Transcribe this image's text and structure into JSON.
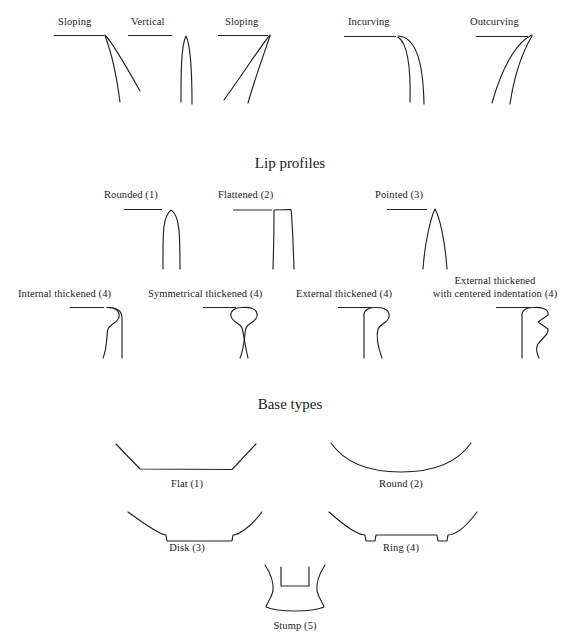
{
  "figure": {
    "title_orientation_row": "Rim orientation types",
    "sections": [
      {
        "id": "lip-profiles",
        "title": "Lip profiles"
      },
      {
        "id": "base-types",
        "title": "Base types"
      }
    ]
  },
  "rim_orientations": [
    {
      "key": "sloping-left",
      "label": "Sloping"
    },
    {
      "key": "vertical",
      "label": "Vertical"
    },
    {
      "key": "sloping-right",
      "label": "Sloping"
    },
    {
      "key": "incurving",
      "label": "Incurving"
    },
    {
      "key": "outcurving",
      "label": "Outcurving"
    }
  ],
  "lip_profiles_row1": [
    {
      "key": "rounded",
      "label": "Rounded (1)"
    },
    {
      "key": "flattened",
      "label": "Flattened (2)"
    },
    {
      "key": "pointed",
      "label": "Pointed (3)"
    }
  ],
  "lip_profiles_row2": [
    {
      "key": "internal-thickened",
      "label": "Internal thickened (4)"
    },
    {
      "key": "symmetrical-thickened",
      "label": "Symmetrical thickened (4)"
    },
    {
      "key": "external-thickened",
      "label": "External thickened (4)"
    },
    {
      "key": "external-thickened-indented",
      "label": "External thickened",
      "label_line2": "with centered indentation (4)"
    }
  ],
  "base_types": [
    {
      "key": "flat",
      "label": "Flat (1)"
    },
    {
      "key": "round",
      "label": "Round (2)"
    },
    {
      "key": "disk",
      "label": "Disk (3)"
    },
    {
      "key": "ring",
      "label": "Ring (4)"
    },
    {
      "key": "stump",
      "label": "Stump (5)"
    }
  ],
  "colors": {
    "ink": "#232323",
    "background": "#ffffff"
  }
}
